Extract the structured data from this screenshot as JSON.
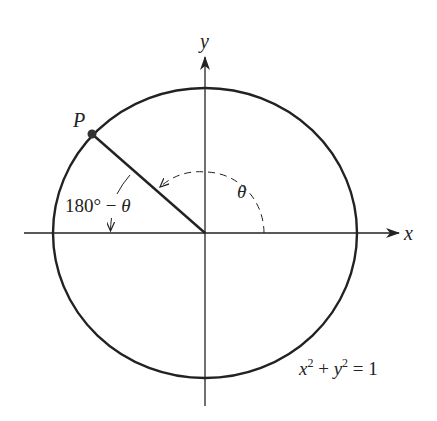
{
  "figure": {
    "type": "unit-circle-diagram",
    "background": "#ffffff",
    "ink_color": "#222222"
  },
  "axes": {
    "x_label": "x",
    "y_label": "y"
  },
  "circle": {
    "equation_lhs_x": "x",
    "equation_sup1": "2",
    "equation_plus": " + ",
    "equation_lhs_y": "y",
    "equation_sup2": "2",
    "equation_rhs": " = 1"
  },
  "point": {
    "label": "P"
  },
  "angles": {
    "theta_label": "θ",
    "supplement_label_prefix": "180° − ",
    "supplement_label_theta": "θ"
  }
}
